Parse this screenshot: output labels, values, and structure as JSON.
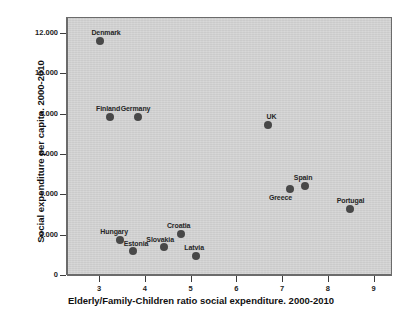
{
  "chart_data": {
    "type": "scatter",
    "title": "",
    "xlabel": "Elderly/Family-Children ratio social expenditure. 2000-2010",
    "ylabel": "Social expenditure per capita. 2000-2010",
    "xlim": [
      2.3,
      9.4
    ],
    "ylim": [
      0,
      12800
    ],
    "xticks": [
      "3",
      "4",
      "5",
      "6",
      "7",
      "8",
      "9"
    ],
    "xtick_values": [
      3,
      4,
      5,
      6,
      7,
      8,
      9
    ],
    "yticks": [
      "0",
      "2.000",
      "4.000",
      "6.000",
      "8.000",
      "10.000",
      "12.000"
    ],
    "ytick_values": [
      0,
      2000,
      4000,
      6000,
      8000,
      10000,
      12000
    ],
    "grid": false,
    "legend": "none",
    "marker_color": "#484848",
    "plot_background": "#d4d4d4",
    "points": [
      {
        "label": "Denmark",
        "x": 3.0,
        "y": 11650,
        "label_dx": 6,
        "label_dy": -12
      },
      {
        "label": "Finland",
        "x": 3.22,
        "y": 7900,
        "label_dx": -2,
        "label_dy": -12
      },
      {
        "label": "Germany",
        "x": 3.82,
        "y": 7900,
        "label_dx": -2,
        "label_dy": -12
      },
      {
        "label": "UK",
        "x": 6.66,
        "y": 7500,
        "label_dx": 4,
        "label_dy": -12
      },
      {
        "label": "Greece",
        "x": 7.16,
        "y": 4300,
        "label_dx": -10,
        "label_dy": 5
      },
      {
        "label": "Spain",
        "x": 7.48,
        "y": 4450,
        "label_dx": -2,
        "label_dy": -12
      },
      {
        "label": "Portugal",
        "x": 8.45,
        "y": 3300,
        "label_dx": 1,
        "label_dy": -12
      },
      {
        "label": "Hungary",
        "x": 3.44,
        "y": 1800,
        "label_dx": -6,
        "label_dy": -12
      },
      {
        "label": "Estonia",
        "x": 3.72,
        "y": 1250,
        "label_dx": 3,
        "label_dy": -11
      },
      {
        "label": "Slovakia",
        "x": 4.4,
        "y": 1450,
        "label_dx": -4,
        "label_dy": -11
      },
      {
        "label": "Croatia",
        "x": 4.76,
        "y": 2100,
        "label_dx": -2,
        "label_dy": -12
      },
      {
        "label": "Latvia",
        "x": 5.1,
        "y": 1000,
        "label_dx": -2,
        "label_dy": -12
      }
    ]
  },
  "axes": {
    "x_title": "Elderly/Family-Children ratio social expenditure. 2000-2010",
    "y_title": "Social expenditure per capita. 2000-2010"
  }
}
